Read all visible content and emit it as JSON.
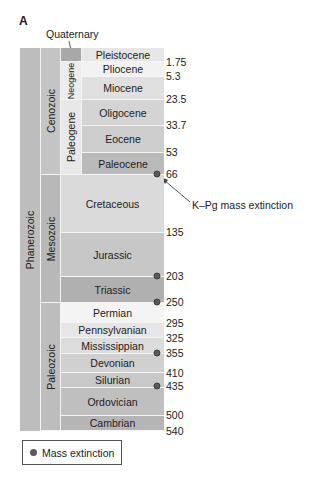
{
  "panel_label": "A",
  "quaternary_label": "Quaternary",
  "eon": {
    "label": "Phanerozoic",
    "color": "#bdbdbd"
  },
  "eras": [
    {
      "label": "Cenozoic",
      "top": 48,
      "bottom": 175,
      "color": "#c4c4c4"
    },
    {
      "label": "Mesozoic",
      "top": 175,
      "bottom": 303,
      "color": "#b8b8b8"
    },
    {
      "label": "Paleozoic",
      "top": 303,
      "bottom": 431,
      "color": "#bdbdbd"
    }
  ],
  "cenozoic_periods": [
    {
      "label": "",
      "name": "Quaternary",
      "top": 48,
      "bottom": 62,
      "color": "#a8a8a8"
    },
    {
      "label": "Neogene",
      "top": 62,
      "bottom": 100,
      "color": "#ececec"
    },
    {
      "label": "Paleogene",
      "top": 100,
      "bottom": 175,
      "color": "#e8e8e8"
    }
  ],
  "units": [
    {
      "label": "Pleistocene",
      "top": 48,
      "bottom": 62,
      "left": 82,
      "color": "#e6e6e6"
    },
    {
      "label": "Pliocene",
      "top": 62,
      "bottom": 77,
      "left": 82,
      "color": "#f2f2f2"
    },
    {
      "label": "Miocene",
      "top": 77,
      "bottom": 100,
      "left": 82,
      "color": "#e0e0e0"
    },
    {
      "label": "Oligocene",
      "top": 100,
      "bottom": 126,
      "left": 82,
      "color": "#d4d4d4"
    },
    {
      "label": "Eocene",
      "top": 126,
      "bottom": 153,
      "left": 82,
      "color": "#cdcdcd"
    },
    {
      "label": "Paleocene",
      "top": 153,
      "bottom": 175,
      "left": 82,
      "color": "#bababa"
    },
    {
      "label": "Cretaceous",
      "top": 175,
      "bottom": 233,
      "left": 61,
      "color": "#dadada"
    },
    {
      "label": "Jurassic",
      "top": 233,
      "bottom": 277,
      "left": 61,
      "color": "#c7c7c7"
    },
    {
      "label": "Triassic",
      "top": 277,
      "bottom": 303,
      "left": 61,
      "color": "#b0b0b0"
    },
    {
      "label": "Permian",
      "top": 303,
      "bottom": 323,
      "left": 61,
      "color": "#f4f4f4"
    },
    {
      "label": "Pennsylvanian",
      "top": 323,
      "bottom": 338,
      "left": 61,
      "color": "#e6e6e6"
    },
    {
      "label": "Mississippian",
      "top": 338,
      "bottom": 354,
      "left": 61,
      "color": "#dcdcdc"
    },
    {
      "label": "Devonian",
      "top": 354,
      "bottom": 373,
      "left": 61,
      "color": "#d0d0d0"
    },
    {
      "label": "Silurian",
      "top": 373,
      "bottom": 388,
      "left": 61,
      "color": "#c8c8c8"
    },
    {
      "label": "Ordovician",
      "top": 388,
      "bottom": 416,
      "left": 61,
      "color": "#bfbfbf"
    },
    {
      "label": "Cambrian",
      "top": 416,
      "bottom": 431,
      "left": 61,
      "color": "#b5b5b5"
    }
  ],
  "ages": [
    {
      "value": "1.75",
      "y": 62
    },
    {
      "value": "5.3",
      "y": 76
    },
    {
      "value": "23.5",
      "y": 99
    },
    {
      "value": "33.7",
      "y": 125
    },
    {
      "value": "53",
      "y": 152
    },
    {
      "value": "66",
      "y": 174
    },
    {
      "value": "135",
      "y": 232
    },
    {
      "value": "203",
      "y": 276
    },
    {
      "value": "250",
      "y": 302
    },
    {
      "value": "295",
      "y": 323
    },
    {
      "value": "325",
      "y": 338
    },
    {
      "value": "355",
      "y": 353
    },
    {
      "value": "410",
      "y": 373
    },
    {
      "value": "435",
      "y": 386
    },
    {
      "value": "500",
      "y": 415
    },
    {
      "value": "540",
      "y": 431
    }
  ],
  "mass_extinctions": [
    {
      "age": "66",
      "y": 174
    },
    {
      "age": "203",
      "y": 276
    },
    {
      "age": "250",
      "y": 302
    },
    {
      "age": "355",
      "y": 353
    },
    {
      "age": "435",
      "y": 386
    }
  ],
  "annotation": {
    "label": "K–Pg mass extinction"
  },
  "legend": {
    "label": "Mass extinction"
  },
  "colors": {
    "dot": "#5a5a5a",
    "text": "#222222"
  }
}
